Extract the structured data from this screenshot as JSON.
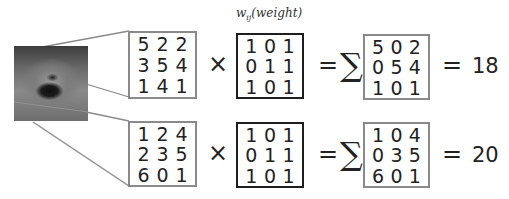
{
  "weight_label": {
    "symbol": "w",
    "subscript": "ij",
    "text": "(weight)"
  },
  "operators": {
    "multiply": "×",
    "equals": "=",
    "sum": "∑"
  },
  "image": {
    "description": "grayscale photo of a fluffy dog (Pomeranian) with open mouth"
  },
  "rows": [
    {
      "input": [
        [
          "5",
          "2",
          "2"
        ],
        [
          "3",
          "5",
          "4"
        ],
        [
          "1",
          "4",
          "1"
        ]
      ],
      "weight": [
        [
          "1",
          "0",
          "1"
        ],
        [
          "0",
          "1",
          "1"
        ],
        [
          "1",
          "0",
          "1"
        ]
      ],
      "product": [
        [
          "5",
          "0",
          "2"
        ],
        [
          "0",
          "5",
          "4"
        ],
        [
          "1",
          "0",
          "1"
        ]
      ],
      "total": "18"
    },
    {
      "input": [
        [
          "1",
          "2",
          "4"
        ],
        [
          "2",
          "3",
          "5"
        ],
        [
          "6",
          "0",
          "1"
        ]
      ],
      "weight": [
        [
          "1",
          "0",
          "1"
        ],
        [
          "0",
          "1",
          "1"
        ],
        [
          "1",
          "0",
          "1"
        ]
      ],
      "product": [
        [
          "1",
          "0",
          "4"
        ],
        [
          "0",
          "3",
          "5"
        ],
        [
          "6",
          "0",
          "1"
        ]
      ],
      "total": "20"
    }
  ],
  "colors": {
    "input_border": "#8a8a8a",
    "weight_border": "#1e1e1e",
    "result_border": "#8a8a8a",
    "connector": "#8a8a8a"
  }
}
